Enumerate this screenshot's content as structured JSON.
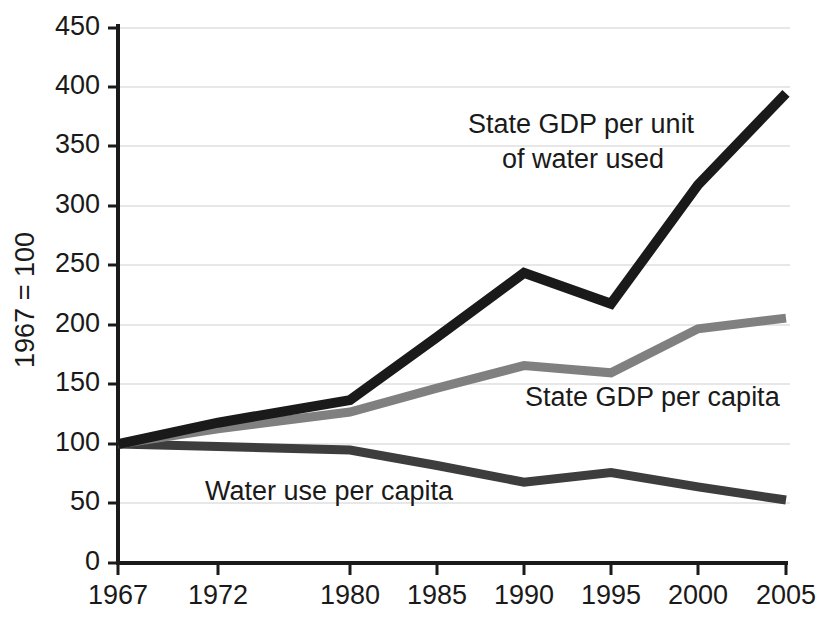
{
  "chart_data": {
    "type": "line",
    "title": "",
    "subtitle": "",
    "xlabel": "",
    "ylabel": "1967 = 100",
    "categories": [
      "1967",
      "1972",
      "1980",
      "1985",
      "1990",
      "1995",
      "2000",
      "2005"
    ],
    "x": [
      1967,
      1972,
      1980,
      1985,
      1990,
      1995,
      2000,
      2005
    ],
    "xticklabels": [
      "1967",
      "1972",
      "1980",
      "1985",
      "1990",
      "1995",
      "2000",
      "2005"
    ],
    "yticklabels": [
      "0",
      "50",
      "100",
      "150",
      "200",
      "250",
      "300",
      "350",
      "400",
      "450"
    ],
    "yticks": [
      0,
      50,
      100,
      150,
      200,
      250,
      300,
      350,
      400,
      450
    ],
    "ylim": [
      0,
      450
    ],
    "grid": "horizontal",
    "legend": "inline-annotations",
    "series": [
      {
        "name": "State GDP per unit of water used",
        "color": "#1a1a1a",
        "values": [
          100,
          118,
          137,
          190,
          244,
          218,
          318,
          395
        ]
      },
      {
        "name": "State GDP per capita",
        "color": "#808080",
        "values": [
          100,
          113,
          127,
          147,
          166,
          160,
          197,
          206
        ]
      },
      {
        "name": "Water use per capita",
        "color": "#3d3d3d",
        "values": [
          100,
          98,
          95,
          82,
          68,
          76,
          64,
          53
        ]
      }
    ],
    "annotations": [
      {
        "id": "annot-gdp-per-water",
        "lines": [
          "State GDP per unit",
          "of water used"
        ],
        "series": "State GDP per unit of water used"
      },
      {
        "id": "annot-gdp-per-capita",
        "lines": [
          "State GDP per capita"
        ],
        "series": "State GDP per capita"
      },
      {
        "id": "annot-water-use",
        "lines": [
          "Water use per capita"
        ],
        "series": "Water use per capita"
      }
    ]
  },
  "axes": {
    "y_title": "1967 = 100",
    "y_labels": {
      "v450": "450",
      "v400": "400",
      "v350": "350",
      "v300": "300",
      "v250": "250",
      "v200": "200",
      "v150": "150",
      "v100": "100",
      "v50": "50",
      "v0": "0"
    },
    "x_labels": {
      "t1967": "1967",
      "t1972": "1972",
      "t1980": "1980",
      "t1985": "1985",
      "t1990": "1990",
      "t1995": "1995",
      "t2000": "2000",
      "t2005": "2005"
    }
  },
  "annotations": {
    "gdp_water_line1": "State GDP per unit",
    "gdp_water_line2": "of water used",
    "gdp_capita": "State GDP per capita",
    "water_use": "Water use per capita"
  },
  "colors": {
    "series_black": "#1a1a1a",
    "series_gray": "#808080",
    "series_darkgray": "#3d3d3d",
    "grid": "#cfcfcf",
    "axis": "#1a1a1a",
    "background": "#ffffff"
  }
}
